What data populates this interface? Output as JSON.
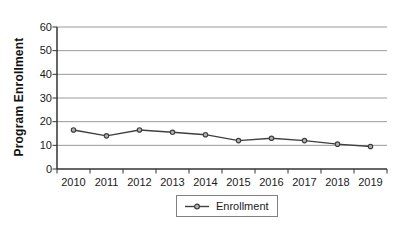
{
  "chart_data": {
    "type": "line",
    "title": "",
    "xlabel": "",
    "ylabel": "Program Enrollment",
    "categories": [
      "2010",
      "2011",
      "2012",
      "2013",
      "2014",
      "2015",
      "2016",
      "2017",
      "2018",
      "2019"
    ],
    "series": [
      {
        "name": "Enrollment",
        "values": [
          16.5,
          14,
          16.5,
          15.5,
          14.5,
          12,
          13,
          12,
          10.5,
          9.5
        ]
      }
    ],
    "ylim": [
      0,
      60
    ],
    "ytick_step": 10,
    "grid": "horizontal",
    "legend_position": "bottom-center",
    "marker": "circle",
    "colors": {
      "line": "#3f3f3f",
      "marker_fill": "#b3b3b3",
      "marker_stroke": "#3f3f3f",
      "gridline": "#999999",
      "axis": "#333333",
      "tick": "#333333",
      "text": "#1a1a1a",
      "legend_border": "#808080",
      "background": "#ffffff"
    }
  }
}
